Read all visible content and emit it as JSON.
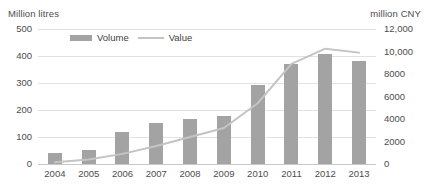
{
  "chart_data": {
    "type": "bar",
    "title": "",
    "categories": [
      "2004",
      "2005",
      "2006",
      "2007",
      "2008",
      "2009",
      "2010",
      "2011",
      "2012",
      "2013"
    ],
    "xlabel": "",
    "ylabel": "Million litres",
    "y2label": "million CNY",
    "ylim": [
      0,
      500
    ],
    "y2lim": [
      0,
      12000
    ],
    "yticks": [
      "0",
      "100",
      "200",
      "300",
      "400",
      "500"
    ],
    "ytick_values": [
      0,
      100,
      200,
      300,
      400,
      500
    ],
    "y2ticks": [
      "0",
      "2000",
      "4000",
      "6000",
      "8000",
      "10,000",
      "12,000"
    ],
    "y2tick_values": [
      0,
      2000,
      4000,
      6000,
      8000,
      10000,
      12000
    ],
    "grid": true,
    "legend_position": "top-center",
    "series": [
      {
        "name": "Volume",
        "type": "bar",
        "axis": "left",
        "unit": "Million litres",
        "color": "#a3a3a3",
        "values": [
          40,
          52,
          120,
          152,
          167,
          178,
          293,
          370,
          408,
          382
        ]
      },
      {
        "name": "Value",
        "type": "line",
        "axis": "right",
        "unit": "million CNY",
        "color": "#c4c4c4",
        "values": [
          150,
          400,
          900,
          1600,
          2400,
          3200,
          5400,
          8900,
          10250,
          9900
        ]
      }
    ]
  },
  "legend": {
    "volume_label": "Volume",
    "value_label": "Value"
  },
  "axes": {
    "left_title": "Million litres",
    "right_title": "million CNY"
  }
}
